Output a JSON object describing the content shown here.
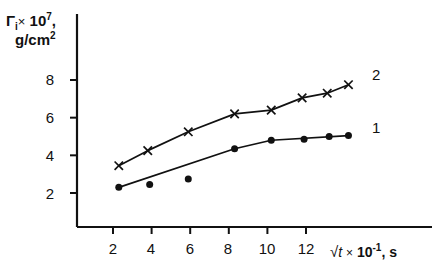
{
  "chart_data": {
    "type": "line",
    "title": "",
    "subtitle": "",
    "xlabel": "√t × 10⁻¹, s",
    "ylabel": "Γi × 10⁷, g/cm²",
    "xlim": [
      0,
      15.2
    ],
    "ylim": [
      0,
      9.4
    ],
    "xticks": [
      2,
      4,
      6,
      8,
      10,
      12
    ],
    "yticks": [
      2,
      4,
      6,
      8
    ],
    "grid": false,
    "legend_position": "right-of-curve-ends",
    "series": [
      {
        "name": "1",
        "marker": "filled-circle",
        "label": "1",
        "x": [
          2.3,
          3.9,
          5.9,
          8.3,
          10.2,
          11.9,
          13.2,
          14.2
        ],
        "values": [
          2.3,
          2.45,
          2.75,
          4.35,
          4.8,
          4.85,
          5.0,
          5.05
        ],
        "line_x": [
          2.3,
          8.3,
          10.2,
          14.2
        ],
        "line_y": [
          2.3,
          4.35,
          4.8,
          5.05
        ]
      },
      {
        "name": "2",
        "marker": "cross",
        "label": "2",
        "x": [
          2.3,
          3.8,
          5.9,
          8.3,
          10.2,
          11.8,
          13.1,
          14.2
        ],
        "values": [
          3.45,
          4.25,
          5.25,
          6.2,
          6.4,
          7.05,
          7.3,
          7.75
        ],
        "line_x": [
          2.3,
          3.8,
          5.9,
          8.3,
          10.2,
          11.8,
          13.1,
          14.2
        ],
        "line_y": [
          3.45,
          4.25,
          5.25,
          6.2,
          6.4,
          7.05,
          7.3,
          7.75
        ]
      }
    ],
    "colors": {
      "axis": "#111111",
      "curve1": "#111111",
      "curve2": "#111111",
      "background": "#ffffff"
    }
  },
  "axis_labels": {
    "y_line1_prefix": "Γ",
    "y_line1_sub": "i",
    "y_line1_times": "×",
    "y_line1_base": "10",
    "y_line1_exp": "7",
    "y_line1_suffix": ",",
    "y_line2": "g/cm",
    "y_line2_exp": "2",
    "x_radical": "√",
    "x_radicand": "t",
    "x_times": "×",
    "x_base": "10",
    "x_exp": "-1",
    "x_unit": ", s"
  },
  "y_tick_labels": [
    "8",
    "6",
    "4",
    "2"
  ],
  "x_tick_labels": [
    "2",
    "4",
    "6",
    "8",
    "10",
    "12"
  ],
  "curve_labels": {
    "upper": "2",
    "lower": "1"
  }
}
